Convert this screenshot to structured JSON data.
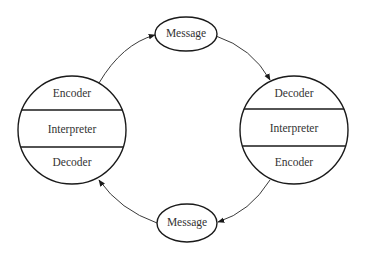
{
  "diagram": {
    "type": "communication-cycle",
    "left_node": {
      "sections": [
        {
          "label": "Encoder"
        },
        {
          "label": "Interpreter"
        },
        {
          "label": "Decoder"
        }
      ]
    },
    "right_node": {
      "sections": [
        {
          "label": "Decoder"
        },
        {
          "label": "Interpreter"
        },
        {
          "label": "Encoder"
        }
      ]
    },
    "top_message": {
      "label": "Message"
    },
    "bottom_message": {
      "label": "Message"
    },
    "edges": [
      {
        "from": "left_node.Encoder",
        "to": "top_message"
      },
      {
        "from": "top_message",
        "to": "right_node.Decoder"
      },
      {
        "from": "right_node.Encoder",
        "to": "bottom_message"
      },
      {
        "from": "bottom_message",
        "to": "left_node.Decoder"
      }
    ],
    "colors": {
      "stroke": "#1a1a1a",
      "text": "#333333",
      "background": "#ffffff"
    }
  }
}
